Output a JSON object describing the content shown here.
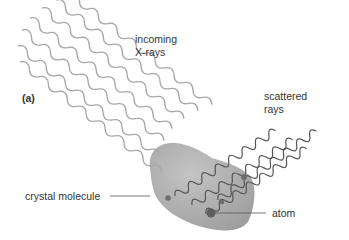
{
  "figure": {
    "panel_label": "(a)",
    "labels": {
      "incoming_line1": "incoming",
      "incoming_line2": "X-rays",
      "scattered_line1": "scattered",
      "scattered_line2": "rays",
      "molecule": "crystal molecule",
      "atom": "atom"
    },
    "colors": {
      "background": "#ffffff",
      "incoming_wave": "#a8a8a8",
      "scattered_wave": "#555555",
      "molecule_fill": "#a9a9a9",
      "molecule_light": "#c2c2c2",
      "atom": "#6e6e6e",
      "leader_line": "#555555",
      "text": "#333333"
    }
  }
}
